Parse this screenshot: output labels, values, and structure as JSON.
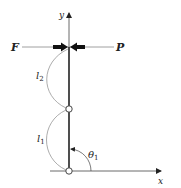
{
  "diagram": {
    "type": "mechanics-free-body-diagram",
    "axes": {
      "x_label": "x",
      "y_label": "y"
    },
    "forces": [
      {
        "name": "F",
        "label": "F",
        "direction": "right",
        "side": "left"
      },
      {
        "name": "P",
        "label": "P",
        "direction": "left",
        "side": "right"
      }
    ],
    "links": [
      {
        "name": "l1",
        "label": "l",
        "subscript": "1",
        "position": "lower"
      },
      {
        "name": "l2",
        "label": "l",
        "subscript": "2",
        "position": "upper"
      }
    ],
    "angle": {
      "label": "θ",
      "subscript": "1"
    },
    "joints": [
      {
        "name": "middle-hinge"
      },
      {
        "name": "base-pivot"
      }
    ],
    "colors": {
      "stroke": "#222222",
      "light_stroke": "#777777",
      "background": "#ffffff"
    }
  }
}
